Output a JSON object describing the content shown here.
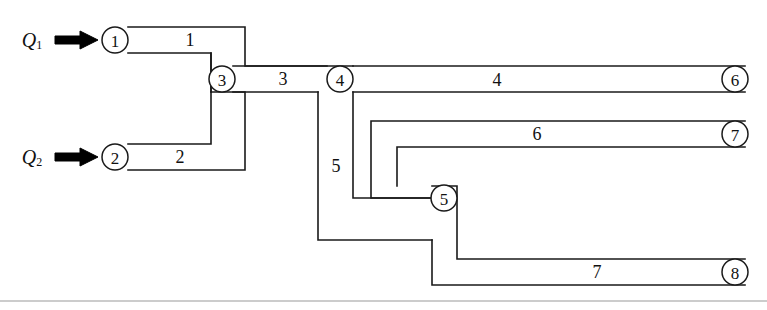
{
  "figure": {
    "kind": "pipe-network-schematic",
    "width": 767,
    "height": 310,
    "background_color": "#ffffff",
    "line_color": "#1a1a1a",
    "rule_color": "#9a9a9a"
  },
  "inflows": [
    {
      "id": "Q1",
      "symbol": "Q",
      "subscript": "1",
      "target_node": "1",
      "x": 40,
      "y": 40
    },
    {
      "id": "Q2",
      "symbol": "Q",
      "subscript": "2",
      "target_node": "2",
      "x": 40,
      "y": 157
    }
  ],
  "nodes": [
    {
      "id": "1",
      "label": "1",
      "cx": 115,
      "cy": 40,
      "r": 13
    },
    {
      "id": "2",
      "label": "2",
      "cx": 115,
      "cy": 157,
      "r": 13
    },
    {
      "id": "3",
      "label": "3",
      "cx": 222,
      "cy": 79,
      "r": 13
    },
    {
      "id": "4",
      "label": "4",
      "cx": 340,
      "cy": 79,
      "r": 13
    },
    {
      "id": "5",
      "label": "5",
      "cx": 444,
      "cy": 198,
      "r": 13
    },
    {
      "id": "6",
      "label": "6",
      "cx": 735,
      "cy": 79,
      "r": 13
    },
    {
      "id": "7",
      "label": "7",
      "cx": 735,
      "cy": 134,
      "r": 13
    },
    {
      "id": "8",
      "label": "8",
      "cx": 735,
      "cy": 272,
      "r": 13
    }
  ],
  "pipes": [
    {
      "id": "pipe-1",
      "label": "1",
      "from_node": "1",
      "to_node": "3",
      "label_x": 190,
      "label_y": 40
    },
    {
      "id": "pipe-2",
      "label": "2",
      "from_node": "2",
      "to_node": "3",
      "label_x": 180,
      "label_y": 157
    },
    {
      "id": "pipe-3",
      "label": "3",
      "from_node": "3",
      "to_node": "4",
      "label_x": 283,
      "label_y": 79
    },
    {
      "id": "pipe-4",
      "label": "4",
      "from_node": "4",
      "to_node": "6",
      "label_x": 497,
      "label_y": 80
    },
    {
      "id": "pipe-5",
      "label": "5",
      "from_node": "4",
      "to_node": "5",
      "label_x": 336,
      "label_y": 166
    },
    {
      "id": "pipe-6",
      "label": "6",
      "from_node": "5",
      "to_node": "7",
      "label_x": 537,
      "label_y": 134
    },
    {
      "id": "pipe-7",
      "label": "7",
      "from_node": "5",
      "to_node": "8",
      "label_x": 597,
      "label_y": 272
    }
  ],
  "wall_paths": {
    "pipe1_outer": "M 128 27 L 245 27 L 245 66 L 353 66",
    "pipe1_inner": "M 128 53 L 211 53 L 211 92",
    "pipe2_outer": "M 128 170 L 245 170 L 245 92 L 211 92",
    "pipe2_inner": "M 128 144 L 211 144 L 211 53",
    "pipe3_top_seg": "M 233 66 L 327 66",
    "pipe3_bot_seg": "M 233 92 L 318 92",
    "pipe5_left": "M 318 92 L 318 240 L 432 240",
    "pipe5_right": "M 353 92 L 353 198 L 432 198",
    "pipe4_top": "M 353 66 L 745 66",
    "pipe4_bot": "M 353 92 L 745 92",
    "pipe6_outer": "M 745 121 L 371 121 L 371 198 L 432 198",
    "pipe6_inner": "M 745 147 L 397 147 L 397 186",
    "pipe7_outer": "M 745 259 L 457 259 L 457 186 L 432 186",
    "pipe7_inner": "M 745 285 L 432 285 L 432 240",
    "bottom_rule": "M 0 301 L 767 301"
  }
}
